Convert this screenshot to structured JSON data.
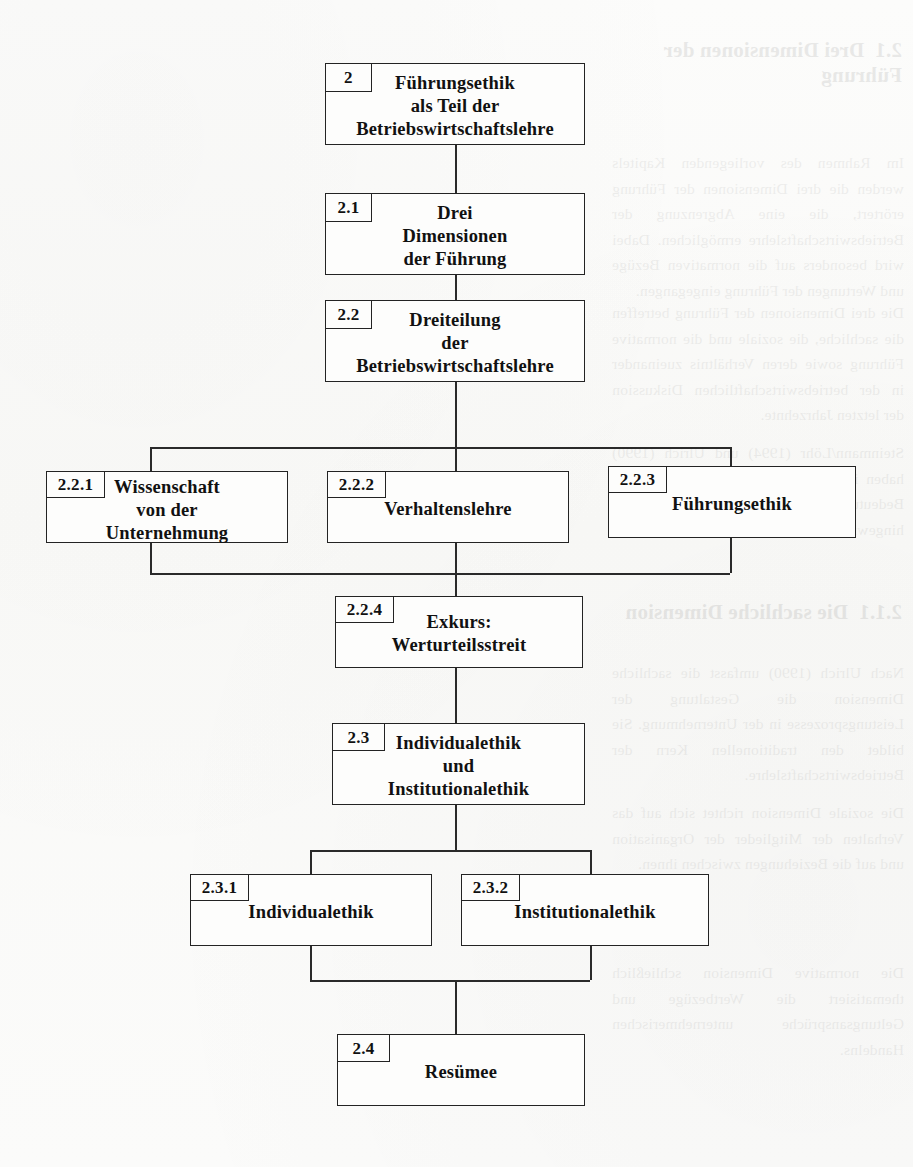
{
  "document": {
    "type": "hierarchical-outline-diagram",
    "language": "de",
    "page_background": "#fbfbfa",
    "ink_color": "#232323"
  },
  "nodes": [
    {
      "id": "n2",
      "number": "2",
      "title": "Führungsethik\nals Teil der\nBetriebswirtschaftslehre",
      "x": 325,
      "y": 63,
      "w": 260,
      "h": 82,
      "label_w": 46,
      "label_h": 28,
      "title_top": 8
    },
    {
      "id": "n21",
      "number": "2.1",
      "title": "Drei\nDimensionen\nder Führung",
      "x": 325,
      "y": 193,
      "w": 260,
      "h": 82,
      "label_w": 46,
      "label_h": 28,
      "title_top": 8
    },
    {
      "id": "n22",
      "number": "2.2",
      "title": "Dreiteilung\nder\nBetriebswirtschaftslehre",
      "x": 325,
      "y": 300,
      "w": 260,
      "h": 82,
      "label_w": 46,
      "label_h": 28,
      "title_top": 8
    },
    {
      "id": "n221",
      "number": "2.2.1",
      "title": "Wissenschaft\nvon der\nUnternehmung",
      "x": 46,
      "y": 471,
      "w": 242,
      "h": 72,
      "label_w": 58,
      "label_h": 26,
      "title_top": 4
    },
    {
      "id": "n222",
      "number": "2.2.2",
      "title": "Verhaltenslehre",
      "x": 327,
      "y": 471,
      "w": 242,
      "h": 72,
      "label_w": 58,
      "label_h": 26,
      "title_top": 26
    },
    {
      "id": "n223",
      "number": "2.2.3",
      "title": "Führungsethik",
      "x": 608,
      "y": 466,
      "w": 248,
      "h": 72,
      "label_w": 58,
      "label_h": 26,
      "title_top": 26
    },
    {
      "id": "n224",
      "number": "2.2.4",
      "title": "Exkurs:\nWerturteilsstreit",
      "x": 335,
      "y": 596,
      "w": 248,
      "h": 72,
      "label_w": 58,
      "label_h": 26,
      "title_top": 14
    },
    {
      "id": "n23",
      "number": "2.3",
      "title": "Individualethik\nund\nInstitutionalethik",
      "x": 332,
      "y": 723,
      "w": 253,
      "h": 82,
      "label_w": 52,
      "label_h": 27,
      "title_top": 8
    },
    {
      "id": "n231",
      "number": "2.3.1",
      "title": "Individualethik",
      "x": 190,
      "y": 874,
      "w": 242,
      "h": 72,
      "label_w": 58,
      "label_h": 26,
      "title_top": 26
    },
    {
      "id": "n232",
      "number": "2.3.2",
      "title": "Institutionalethik",
      "x": 461,
      "y": 874,
      "w": 248,
      "h": 72,
      "label_w": 58,
      "label_h": 26,
      "title_top": 26
    },
    {
      "id": "n24",
      "number": "2.4",
      "title": "Resümee",
      "x": 337,
      "y": 1034,
      "w": 248,
      "h": 72,
      "label_w": 52,
      "label_h": 27,
      "title_top": 26
    }
  ],
  "connectors": [
    {
      "id": "c1",
      "orient": "v",
      "x": 455,
      "y": 145,
      "len": 48
    },
    {
      "id": "c2",
      "orient": "v",
      "x": 455,
      "y": 275,
      "len": 25
    },
    {
      "id": "c3",
      "orient": "v",
      "x": 455,
      "y": 382,
      "len": 65
    },
    {
      "id": "c4",
      "orient": "h",
      "x": 150,
      "y": 447,
      "len": 580
    },
    {
      "id": "c5",
      "orient": "v",
      "x": 150,
      "y": 447,
      "len": 24
    },
    {
      "id": "c6",
      "orient": "v",
      "x": 730,
      "y": 447,
      "len": 19
    },
    {
      "id": "c7",
      "orient": "v",
      "x": 455,
      "y": 447,
      "len": 24
    },
    {
      "id": "c8",
      "orient": "v",
      "x": 150,
      "y": 543,
      "len": 30
    },
    {
      "id": "c9",
      "orient": "v",
      "x": 455,
      "y": 543,
      "len": 30
    },
    {
      "id": "c10",
      "orient": "v",
      "x": 730,
      "y": 538,
      "len": 35
    },
    {
      "id": "c11",
      "orient": "h",
      "x": 150,
      "y": 573,
      "len": 580
    },
    {
      "id": "c12",
      "orient": "v",
      "x": 455,
      "y": 573,
      "len": 23
    },
    {
      "id": "c13",
      "orient": "v",
      "x": 455,
      "y": 668,
      "len": 55
    },
    {
      "id": "c14",
      "orient": "v",
      "x": 455,
      "y": 805,
      "len": 45
    },
    {
      "id": "c15",
      "orient": "h",
      "x": 310,
      "y": 850,
      "len": 280
    },
    {
      "id": "c16",
      "orient": "v",
      "x": 310,
      "y": 850,
      "len": 24
    },
    {
      "id": "c17",
      "orient": "v",
      "x": 590,
      "y": 850,
      "len": 24
    },
    {
      "id": "c18",
      "orient": "v",
      "x": 310,
      "y": 946,
      "len": 34
    },
    {
      "id": "c19",
      "orient": "v",
      "x": 590,
      "y": 946,
      "len": 34
    },
    {
      "id": "c20",
      "orient": "h",
      "x": 310,
      "y": 980,
      "len": 280
    },
    {
      "id": "c21",
      "orient": "v",
      "x": 455,
      "y": 980,
      "len": 54
    }
  ],
  "bleed_text": [
    {
      "id": "b1",
      "kind": "head",
      "x": 612,
      "y": 38,
      "w": 290,
      "text": "2.1  Drei Dimensionen der Führung"
    },
    {
      "id": "b2",
      "kind": "para",
      "x": 612,
      "y": 150,
      "w": 292,
      "text": "Im Rahmen des vorliegenden Kapitels werden die drei Dimensionen der Führung erörtert, die eine Abgrenzung der Betriebswirtschaftslehre ermöglichen. Dabei wird besonders auf die normativen Bezüge und Wertungen der Führung eingegangen."
    },
    {
      "id": "b3",
      "kind": "para",
      "x": 612,
      "y": 300,
      "w": 292,
      "text": "Die drei Dimensionen der Führung betreffen die sachliche, die soziale und die normative Führung sowie deren Verhältnis zueinander in der betriebswirtschaftlichen Diskussion der letzten Jahrzehnte."
    },
    {
      "id": "b4",
      "kind": "para",
      "x": 612,
      "y": 440,
      "w": 292,
      "text": "Steinmann/Löhr (1994) und Ulrich (1990) haben in ihren Arbeiten wiederholt auf die Bedeutung dieser Unterscheidung hingewiesen."
    },
    {
      "id": "b5",
      "kind": "head",
      "x": 612,
      "y": 600,
      "w": 290,
      "text": "2.1.1  Die sachliche Dimension"
    },
    {
      "id": "b6",
      "kind": "para",
      "x": 612,
      "y": 660,
      "w": 292,
      "text": "Nach Ulrich (1990) umfasst die sachliche Dimension die Gestaltung der Leistungsprozesse in der Unternehmung. Sie bildet den traditionellen Kern der Betriebswirtschaftslehre."
    },
    {
      "id": "b7",
      "kind": "para",
      "x": 612,
      "y": 800,
      "w": 292,
      "text": "Die soziale Dimension richtet sich auf das Verhalten der Mitglieder der Organisation und auf die Beziehungen zwischen ihnen."
    },
    {
      "id": "b8",
      "kind": "para",
      "x": 612,
      "y": 960,
      "w": 292,
      "text": "Die normative Dimension schließlich thematisiert die Wertbezüge und Geltungsansprüche unternehmerischen Handelns."
    }
  ]
}
